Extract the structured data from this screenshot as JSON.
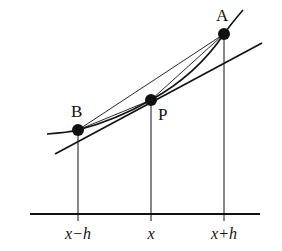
{
  "diagram": {
    "colors": {
      "ink": "#111111",
      "background": "#ffffff"
    },
    "points": [
      {
        "id": "A",
        "label": "A",
        "x": 224,
        "y": 34
      },
      {
        "id": "P",
        "label": "P",
        "x": 151,
        "y": 100
      },
      {
        "id": "B",
        "label": "B",
        "x": 78,
        "y": 130
      }
    ],
    "axis": {
      "y": 214,
      "x_start": 30,
      "x_end": 260,
      "ticks": [
        {
          "x": 78,
          "label": "x−h"
        },
        {
          "x": 151,
          "label": "x"
        },
        {
          "x": 224,
          "label": "x+h"
        }
      ]
    },
    "curve_label": "f(x)",
    "lines": {
      "tangent": "tangent-at-P",
      "secant_BA": "secant-B-A",
      "secant_BP": "secant-B-P",
      "secant_PA": "secant-P-A"
    }
  }
}
